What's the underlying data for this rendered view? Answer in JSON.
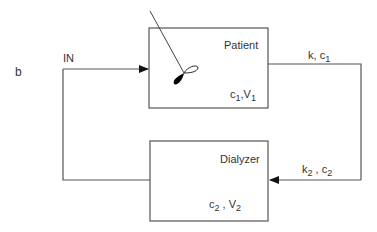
{
  "panel_label": "b",
  "input_label": "IN",
  "patient": {
    "title": "Patient",
    "var_c": "c",
    "var_c_sub": "1",
    "sep": ",",
    "var_v": "V",
    "var_v_sub": "1"
  },
  "dialyzer": {
    "title": "Dialyzer",
    "var_c": "c",
    "var_c_sub": "2",
    "sep": " , ",
    "var_v": "V",
    "var_v_sub": "2"
  },
  "flow_out": {
    "k": "k",
    "sep": ", ",
    "c": "c",
    "c_sub": "1"
  },
  "flow_back": {
    "k": "k",
    "k_sub": "2",
    "sep": " , ",
    "c": "c",
    "c_sub": "2"
  },
  "colors": {
    "line": "#555555",
    "fill": "#000000"
  }
}
